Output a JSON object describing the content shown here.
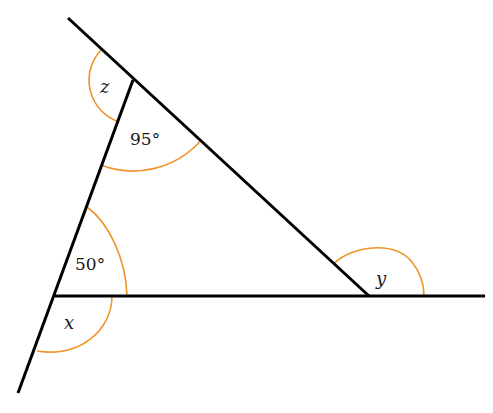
{
  "diagram": {
    "type": "triangle-exterior-angles",
    "colors": {
      "line": "#000000",
      "arc": "#f0932b",
      "text": "#1a1a1a",
      "background": "#ffffff"
    },
    "vertices": {
      "top": [
        133,
        80
      ],
      "bottom_left": [
        55,
        296
      ],
      "right": [
        369,
        296
      ]
    },
    "lines": [
      {
        "name": "slanted-top-line",
        "from": [
          68,
          18
        ],
        "to": [
          369,
          296
        ]
      },
      {
        "name": "left-line",
        "from": [
          133,
          80
        ],
        "to": [
          18,
          393
        ]
      },
      {
        "name": "base-line",
        "from": [
          55,
          296
        ],
        "to": [
          485,
          296
        ]
      }
    ],
    "angles": [
      {
        "name": "z",
        "label": "z",
        "vertex": "top",
        "kind": "exterior"
      },
      {
        "name": "top-interior",
        "label": "95°",
        "vertex": "top",
        "kind": "interior"
      },
      {
        "name": "bottom-left-interior",
        "label": "50°",
        "vertex": "bottom_left",
        "kind": "interior"
      },
      {
        "name": "x",
        "label": "x",
        "vertex": "bottom_left",
        "kind": "vertically-opposite-exterior"
      },
      {
        "name": "y",
        "label": "y",
        "vertex": "right",
        "kind": "exterior"
      }
    ]
  },
  "labels": {
    "z": "z",
    "angle_top": "95°",
    "angle_bottom_left": "50°",
    "x": "x",
    "y": "y"
  }
}
